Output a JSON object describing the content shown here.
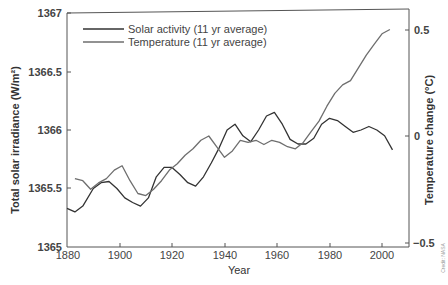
{
  "chart_data": {
    "type": "line",
    "title": "",
    "xlabel": "Year",
    "ylabel": "Total solar irradiance (W/m²)",
    "ylabel_right": "Temperature change (°C)",
    "xlim": [
      1880,
      2010
    ],
    "ylim": [
      1365,
      1367
    ],
    "ylim_right": [
      -0.5,
      0.5
    ],
    "x_ticks": [
      1880,
      1900,
      1920,
      1940,
      1960,
      1980,
      2000
    ],
    "y_ticks": [
      1365,
      1365.5,
      1366,
      1366.5,
      1367
    ],
    "y_ticks_right": [
      -0.5,
      0,
      0.5
    ],
    "grid": false,
    "legend_position": "upper left",
    "series": [
      {
        "name": "Solar activity (11 yr average)",
        "axis": "left",
        "color": "#333333",
        "x": [
          1880,
          1883,
          1886,
          1890,
          1893,
          1896,
          1899,
          1902,
          1905,
          1908,
          1911,
          1914,
          1917,
          1920,
          1923,
          1926,
          1929,
          1932,
          1935,
          1938,
          1941,
          1944,
          1947,
          1950,
          1953,
          1956,
          1959,
          1962,
          1965,
          1968,
          1971,
          1974,
          1977,
          1980,
          1983,
          1986,
          1989,
          1992,
          1995,
          1998,
          2001,
          2004
        ],
        "values": [
          1365.33,
          1365.3,
          1365.35,
          1365.5,
          1365.55,
          1365.56,
          1365.5,
          1365.42,
          1365.38,
          1365.35,
          1365.42,
          1365.6,
          1365.68,
          1365.68,
          1365.62,
          1365.55,
          1365.52,
          1365.6,
          1365.72,
          1365.85,
          1366.0,
          1366.05,
          1365.95,
          1365.9,
          1366.0,
          1366.12,
          1366.15,
          1366.05,
          1365.92,
          1365.88,
          1365.88,
          1365.93,
          1366.05,
          1366.1,
          1366.08,
          1366.03,
          1365.98,
          1366.0,
          1366.03,
          1366.0,
          1365.95,
          1365.83
        ]
      },
      {
        "name": "Temperature (11 yr average)",
        "axis": "right",
        "color": "#6e6e6e",
        "x": [
          1883,
          1886,
          1889,
          1892,
          1895,
          1898,
          1901,
          1904,
          1907,
          1910,
          1913,
          1916,
          1919,
          1922,
          1925,
          1928,
          1931,
          1934,
          1937,
          1940,
          1943,
          1946,
          1949,
          1952,
          1955,
          1958,
          1961,
          1964,
          1967,
          1970,
          1973,
          1976,
          1979,
          1982,
          1985,
          1988,
          1991,
          1994,
          1997,
          2000,
          2003
        ],
        "values": [
          -0.2,
          -0.21,
          -0.25,
          -0.22,
          -0.2,
          -0.16,
          -0.14,
          -0.21,
          -0.27,
          -0.28,
          -0.25,
          -0.21,
          -0.16,
          -0.13,
          -0.09,
          -0.06,
          -0.02,
          0.0,
          -0.05,
          -0.1,
          -0.07,
          -0.02,
          -0.03,
          -0.02,
          -0.04,
          -0.02,
          -0.03,
          -0.05,
          -0.06,
          -0.03,
          0.02,
          0.07,
          0.14,
          0.2,
          0.24,
          0.26,
          0.32,
          0.38,
          0.43,
          0.48,
          0.5
        ]
      }
    ]
  },
  "axes": {
    "x_title": "Year",
    "y_left_title": "Total solar irradiance (W/m²)",
    "y_right_title": "Temperature change (°C)",
    "x_tick_labels": [
      "1880",
      "1900",
      "1920",
      "1940",
      "1960",
      "1980",
      "2000"
    ],
    "y_left_tick_labels": [
      "1367",
      "1366.5",
      "1366",
      "1365.5",
      "1365"
    ],
    "y_right_tick_labels": [
      "0.5",
      "0",
      "−0.5"
    ]
  },
  "legend": {
    "items": [
      {
        "label": "Solar activity (11 yr average)",
        "color": "#333333"
      },
      {
        "label": "Temperature (11 yr average)",
        "color": "#6e6e6e"
      }
    ]
  },
  "credit": "Credit: NASA"
}
